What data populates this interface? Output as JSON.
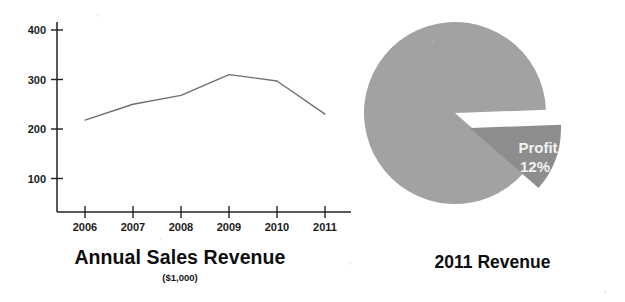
{
  "figure": {
    "background_color": "#ffffff"
  },
  "chart_data": [
    {
      "type": "line",
      "title": "Annual Sales Revenue",
      "subtitle": "($1,000)",
      "xlabel": "",
      "ylabel": "",
      "categories": [
        "2006",
        "2007",
        "2008",
        "2009",
        "2010",
        "2011"
      ],
      "values": [
        218,
        250,
        268,
        310,
        297,
        230
      ],
      "series": [
        {
          "name": "Annual Sales Revenue",
          "values": [
            218,
            250,
            268,
            310,
            297,
            230
          ],
          "color": "#6e6e6e"
        }
      ],
      "ytick_labels": [
        "100",
        "200",
        "300",
        "400"
      ],
      "ytick_values": [
        100,
        200,
        300,
        400
      ],
      "ylim": [
        0,
        430
      ],
      "xlim": [
        "2006",
        "2011"
      ],
      "grid": false,
      "legend": "none",
      "units": "$1,000"
    },
    {
      "type": "pie",
      "title": "2011 Revenue",
      "slices": [
        {
          "label": "",
          "value": 88,
          "percent_text": "",
          "color": "#a2a2a2",
          "exploded": false
        },
        {
          "label": "Profit",
          "value": 12,
          "percent_text": "12%",
          "color": "#8d8d8d",
          "exploded": true
        }
      ],
      "legend": "none",
      "labels_inside": true
    }
  ],
  "line_chart": {
    "title": "Annual Sales Revenue",
    "subtitle": "($1,000)",
    "y_ticks": [
      {
        "label": "400"
      },
      {
        "label": "300"
      },
      {
        "label": "200"
      },
      {
        "label": "100"
      }
    ],
    "x_ticks": [
      {
        "label": "2006"
      },
      {
        "label": "2007"
      },
      {
        "label": "2008"
      },
      {
        "label": "2009"
      },
      {
        "label": "2010"
      },
      {
        "label": "2011"
      }
    ]
  },
  "pie_chart": {
    "title": "2011 Revenue",
    "slice_label": "Profit",
    "slice_percent": "12%"
  },
  "colors": {
    "pie_main": "#a2a2a2",
    "pie_exploded": "#8d8d8d",
    "line": "#6e6e6e",
    "axis": "#222222",
    "text": "#0d0d0d",
    "slice_text": "#f2f2f2"
  }
}
